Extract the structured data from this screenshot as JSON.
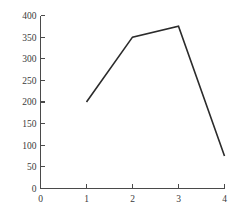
{
  "chart_data": {
    "type": "line",
    "title": "",
    "subtitle": "",
    "xlabel": "",
    "ylabel": "",
    "x": [
      1,
      2,
      3,
      4
    ],
    "values": [
      200,
      350,
      375,
      75
    ],
    "series": [
      {
        "name": "",
        "x": [
          1,
          2,
          3,
          4
        ],
        "values": [
          200,
          350,
          375,
          75
        ]
      }
    ],
    "xlim": [
      0,
      4
    ],
    "ylim": [
      0,
      400
    ],
    "x_ticks": [
      0,
      1,
      2,
      3,
      4
    ],
    "y_ticks": [
      0,
      50,
      100,
      150,
      200,
      250,
      300,
      350,
      400
    ],
    "x_tick_labels": [
      "0",
      "1",
      "2",
      "3",
      "4"
    ],
    "y_tick_labels": [
      "0",
      "50",
      "100",
      "150",
      "200",
      "250",
      "300",
      "350",
      "400"
    ],
    "grid": false,
    "legend": null,
    "annotations": [],
    "colors": {
      "line": "#2b2b2b",
      "axis": "#4a4a4a",
      "text": "#3a3a3a",
      "background": "#ffffff"
    }
  }
}
